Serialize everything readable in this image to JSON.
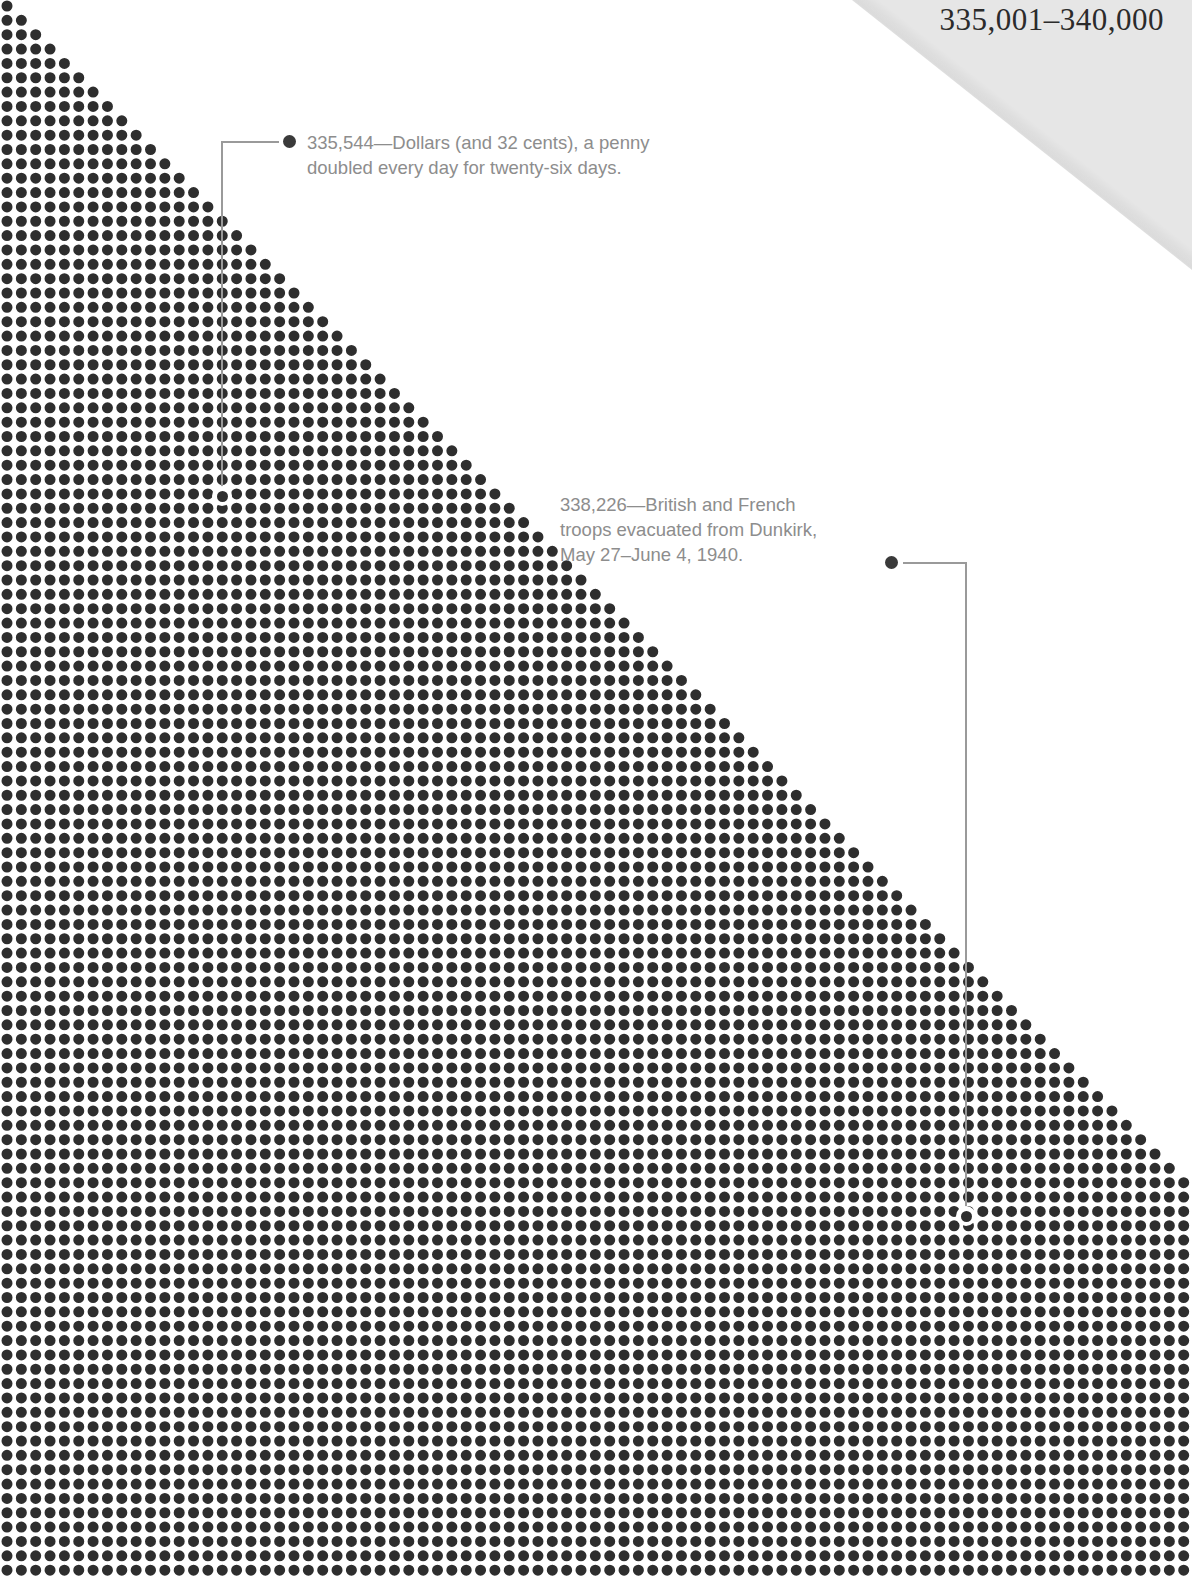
{
  "page": {
    "width": 1192,
    "height": 1576,
    "background_color": "#ffffff",
    "corner_fold_color": "#e6e6e6"
  },
  "header": {
    "range_label": "335,001–340,000"
  },
  "annotations": [
    {
      "id": "penny-doubled",
      "value": "335,544",
      "text": "335,544—Dollars (and 32 cents), a penny\ndoubled every day for twenty-six days.",
      "bullet_x": 289,
      "bullet_y": 141,
      "terminus_x": 222,
      "terminus_y": 496
    },
    {
      "id": "dunkirk-evacuation",
      "value": "338,226",
      "text": "338,226—British and French\ntroops evacuated from Dunkirk,\nMay 27–June 4, 1940.",
      "bullet_x": 891,
      "bullet_y": 562,
      "terminus_x": 966,
      "terminus_y": 1216
    }
  ],
  "chart_data": {
    "type": "scatter",
    "title": "335,001–340,000",
    "dot_color": "#2e2e2e",
    "dot_diameter_px": 11,
    "grid_spacing_px": 14.35,
    "origin_x_px": 7,
    "origin_y_px": 6,
    "columns": 83,
    "rows": 110,
    "diagonal_slope": 1,
    "xlabel": "",
    "ylabel": "",
    "grid": false,
    "legend": false,
    "annotated_points": [
      {
        "label": "335,544 — a penny doubled every day for twenty-six days",
        "value": 335544
      },
      {
        "label": "338,226 — British and French troops evacuated from Dunkirk, May 27–June 4, 1940",
        "value": 338226
      }
    ],
    "range_start": 335001,
    "range_end": 340000
  }
}
